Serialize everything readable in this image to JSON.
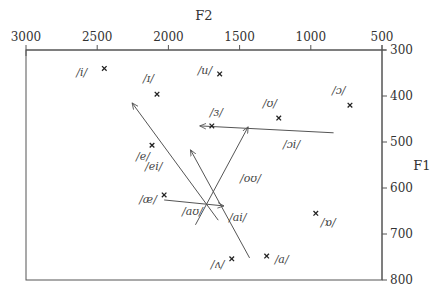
{
  "chart_data": {
    "type": "scatter",
    "title": "",
    "xlabel": "F2",
    "ylabel": "F1",
    "x_axis": {
      "position": "top",
      "reversed": true,
      "range": [
        3000,
        500
      ],
      "ticks": [
        3000,
        2500,
        2000,
        1500,
        1000,
        500
      ]
    },
    "y_axis": {
      "position": "right",
      "reversed": true,
      "range": [
        300,
        800
      ],
      "ticks": [
        300,
        400,
        500,
        600,
        700,
        800
      ]
    },
    "grid": false,
    "monophthongs": [
      {
        "label": "/i/",
        "F2": 2450,
        "F1": 340,
        "label_dx": -28,
        "label_dy": 8
      },
      {
        "label": "/ɪ/",
        "F2": 2080,
        "F1": 396,
        "label_dx": -14,
        "label_dy": -12
      },
      {
        "label": "/u/",
        "F2": 1640,
        "F1": 352,
        "label_dx": -22,
        "label_dy": 0
      },
      {
        "label": "/ʊ/",
        "F2": 1225,
        "F1": 448,
        "label_dx": -16,
        "label_dy": -11
      },
      {
        "label": "/ɔ/",
        "F2": 725,
        "F1": 420,
        "label_dx": -18,
        "label_dy": -11
      },
      {
        "label": "/ɜ/",
        "F2": 1695,
        "F1": 465,
        "label_dx": -2,
        "label_dy": -10
      },
      {
        "label": "/e/",
        "F2": 2115,
        "F1": 507,
        "label_dx": -16,
        "label_dy": 15
      },
      {
        "label": "/æ/",
        "F2": 2030,
        "F1": 615,
        "label_dx": -25,
        "label_dy": 8
      },
      {
        "label": "/ɒ/",
        "F2": 965,
        "F1": 655,
        "label_dx": 5,
        "label_dy": 13
      },
      {
        "label": "/ʌ/",
        "F2": 1555,
        "F1": 754,
        "label_dx": -21,
        "label_dy": 9
      },
      {
        "label": "/a/",
        "F2": 1310,
        "F1": 748,
        "label_dx": 8,
        "label_dy": 7
      }
    ],
    "diphthongs": [
      {
        "label": "/ei/",
        "from": {
          "F2": 1650,
          "F1": 670
        },
        "to": {
          "F2": 2255,
          "F1": 415
        },
        "label_x": 145,
        "label_y": 170
      },
      {
        "label": "/ai/",
        "from": {
          "F2": 1430,
          "F1": 752
        },
        "to": {
          "F2": 1845,
          "F1": 517
        },
        "label_x": 229,
        "label_y": 221
      },
      {
        "label": "/aʊ/",
        "from": {
          "F2": 2030,
          "F1": 626
        },
        "to": {
          "F2": 1610,
          "F1": 639
        },
        "label_x": 182,
        "label_y": 215
      },
      {
        "label": "/oʊ/",
        "from": {
          "F2": 1810,
          "F1": 680
        },
        "to": {
          "F2": 1440,
          "F1": 467
        },
        "label_x": 240,
        "label_y": 182
      },
      {
        "label": "/ɔi/",
        "from": {
          "F2": 840,
          "F1": 480
        },
        "to": {
          "F2": 1780,
          "F1": 465
        },
        "label_x": 283,
        "label_y": 148
      }
    ]
  }
}
